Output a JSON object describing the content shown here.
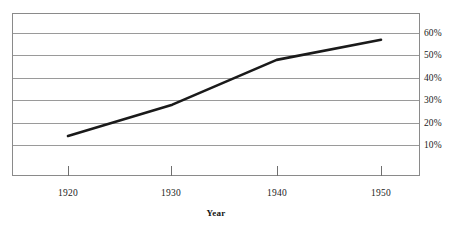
{
  "chart_data": {
    "type": "line",
    "title": "",
    "xlabel": "Year",
    "ylabel": "",
    "x": [
      1920,
      1930,
      1940,
      1950
    ],
    "categories": [
      "1920",
      "1930",
      "1940",
      "1950"
    ],
    "series": [
      {
        "name": "",
        "values": [
          14,
          28,
          48,
          57
        ]
      }
    ],
    "xtick_labels": [
      "1920",
      "1930",
      "1940",
      "1950"
    ],
    "ytick_labels": [
      "10%",
      "20%",
      "30%",
      "40%",
      "50%",
      "60%"
    ],
    "ytick_values": [
      10,
      20,
      30,
      40,
      50,
      60
    ],
    "xlim": [
      1917,
      1954
    ],
    "ylim": [
      0,
      67
    ],
    "grid": "horizontal",
    "legend": "none",
    "line_color": "#1a1a1a",
    "grid_color": "#9a9a9a",
    "frame_color": "#8a8a8a",
    "background_color": "#ffffff"
  },
  "axis": {
    "x_title": "Year",
    "ticks_x": [
      {
        "label": "1920",
        "value": 1920
      },
      {
        "label": "1930",
        "value": 1930
      },
      {
        "label": "1940",
        "value": 1940
      },
      {
        "label": "1950",
        "value": 1950
      }
    ],
    "ticks_y": [
      {
        "label": "60%",
        "value": 60
      },
      {
        "label": "50%",
        "value": 50
      },
      {
        "label": "40%",
        "value": 40
      },
      {
        "label": "30%",
        "value": 30
      },
      {
        "label": "20%",
        "value": 20
      },
      {
        "label": "10%",
        "value": 10
      }
    ]
  }
}
